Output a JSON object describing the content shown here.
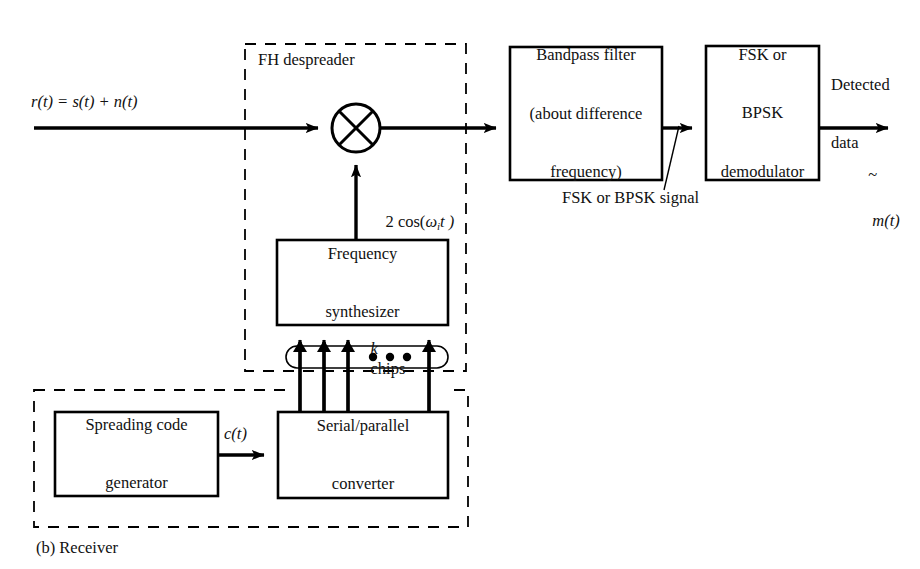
{
  "figure": {
    "caption": "(b) Receiver",
    "background": "#ffffff",
    "stroke": "#000000"
  },
  "groups": [
    {
      "id": "fh-despreader",
      "label": "FH despreader",
      "style": "dashed",
      "x": 245,
      "y": 44,
      "w": 221,
      "h": 327
    },
    {
      "id": "code-generator-group",
      "label": "",
      "style": "dashed",
      "x": 34,
      "y": 390,
      "w": 434,
      "h": 137
    }
  ],
  "blocks": [
    {
      "id": "bandpass-filter",
      "lines": [
        "Bandpass filter",
        "(about difference",
        "frequency)"
      ],
      "x": 510,
      "y": 47,
      "w": 152,
      "h": 133,
      "font": 16.5
    },
    {
      "id": "fsk-bpsk-demodulator",
      "lines": [
        "FSK or",
        "BPSK",
        "demodulator"
      ],
      "x": 706,
      "y": 46,
      "w": 113,
      "h": 134,
      "font": 16.5
    },
    {
      "id": "frequency-synthesizer",
      "lines": [
        "Frequency",
        "synthesizer"
      ],
      "x": 277,
      "y": 240,
      "w": 171,
      "h": 85,
      "font": 16.5
    },
    {
      "id": "serial-parallel-converter",
      "lines": [
        "Serial/parallel",
        "converter"
      ],
      "x": 278,
      "y": 412,
      "w": 170,
      "h": 86,
      "font": 16.5
    },
    {
      "id": "spreading-code-generator",
      "lines": [
        "Spreading code",
        "generator"
      ],
      "x": 55,
      "y": 412,
      "w": 163,
      "h": 84,
      "font": 16.5
    }
  ],
  "signals": {
    "input_received": "r(t) = s(t) + n(t)",
    "local_oscillator_prefix": "2 cos(",
    "local_oscillator_omega": "ω",
    "local_oscillator_sub": "i",
    "local_oscillator_suffix": "t )",
    "bus_label_k": "k",
    "bus_label_chips": "chips",
    "code_signal": "c(t)",
    "intermediate_signal": "FSK or BPSK signal",
    "output_line1": "Detected",
    "output_line2": "data",
    "output_symbol": "m(t)"
  },
  "mixer": {
    "id": "mixer",
    "cx": 356,
    "cy": 128,
    "r": 24,
    "symbol": "multiplier-cross"
  },
  "bus": {
    "arrow_count": 4,
    "dot_count": 3,
    "ellipse_cx": 367,
    "ellipse_cy": 357
  }
}
